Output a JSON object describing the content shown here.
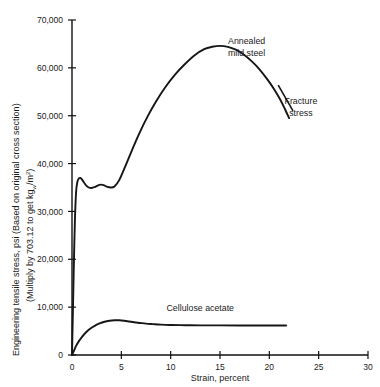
{
  "chart_data": {
    "type": "line",
    "title": "",
    "xlabel": "Strain, percent",
    "ylabel_line1": "Engineering tensile stress, psi (Based on original cross section)",
    "ylabel_line2_pre": "(Multiply by 703.12 to get kg",
    "ylabel_line2_sub": "w",
    "ylabel_line2_mid": "/m",
    "ylabel_line2_sup": "2",
    "ylabel_line2_post": ")",
    "xlim": [
      0,
      30
    ],
    "ylim": [
      0,
      70000
    ],
    "xticks": [
      0,
      5,
      10,
      15,
      20,
      25,
      30
    ],
    "xticklabels": [
      "0",
      "5",
      "10",
      "15",
      "20",
      "25",
      "30"
    ],
    "yticks": [
      0,
      10000,
      20000,
      30000,
      40000,
      50000,
      60000,
      70000
    ],
    "yticklabels": [
      "0",
      "10,000",
      "20,000",
      "30,000",
      "40,000",
      "50,000",
      "60,000",
      "70,000"
    ],
    "grid": false,
    "legend_position": "inline-annotation",
    "line_color": "#161616",
    "series": [
      {
        "name": "Annealed mild steel",
        "x": [
          0.0,
          0.12,
          0.2,
          0.3,
          0.42,
          0.55,
          0.7,
          0.85,
          1.0,
          1.2,
          1.45,
          1.7,
          2.0,
          2.3,
          2.6,
          2.9,
          3.2,
          3.5,
          3.9,
          4.3,
          4.8,
          5.4,
          6.0,
          6.8,
          7.6,
          8.5,
          9.4,
          10.4,
          11.4,
          12.4,
          13.4,
          14.2,
          15.0,
          15.8,
          16.6,
          17.4,
          18.2,
          19.0,
          19.8,
          20.5,
          21.1,
          21.6,
          22.0
        ],
        "y": [
          0,
          12000,
          20000,
          28500,
          34200,
          36200,
          36900,
          37000,
          36700,
          36100,
          35400,
          35000,
          34900,
          35100,
          35400,
          35600,
          35500,
          35200,
          35000,
          35200,
          36600,
          39400,
          42400,
          46200,
          49600,
          52900,
          55800,
          58500,
          60700,
          62600,
          63900,
          64400,
          64600,
          64400,
          63800,
          62800,
          61400,
          59700,
          57600,
          55500,
          53400,
          51300,
          49500
        ]
      },
      {
        "name": "Cellulose acetate",
        "x": [
          0.0,
          0.2,
          0.4,
          0.7,
          1.0,
          1.4,
          1.8,
          2.3,
          2.8,
          3.3,
          3.8,
          4.3,
          4.8,
          5.3,
          5.8,
          6.3,
          6.9,
          7.5,
          8.2,
          9.0,
          10.0,
          11.5,
          13.0,
          15.0,
          17.0,
          19.0,
          20.5,
          21.7
        ],
        "y": [
          0,
          900,
          1850,
          2900,
          3750,
          4700,
          5450,
          6100,
          6600,
          6950,
          7150,
          7250,
          7250,
          7150,
          7000,
          6850,
          6700,
          6550,
          6450,
          6350,
          6280,
          6230,
          6200,
          6180,
          6170,
          6160,
          6155,
          6150
        ]
      }
    ],
    "annotations": [
      {
        "name": "annealed-mild-steel",
        "text_line1": "Annealed",
        "text_line2": "mild steel",
        "x": 17.7,
        "y": 65000
      },
      {
        "name": "fracture-stress",
        "text_line1": "Fracture",
        "text_line2": "stress",
        "x": 23.2,
        "y": 52500,
        "leader": {
          "x1": 22.4,
          "y1": 51000,
          "x2": 20.9,
          "y2": 56400
        }
      },
      {
        "name": "cellulose-acetate",
        "text_line1": "Cellulose acetate",
        "text_line2": "",
        "x": 13.0,
        "y": 9200
      }
    ]
  }
}
